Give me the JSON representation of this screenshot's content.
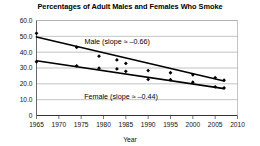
{
  "chart_data": {
    "type": "scatter",
    "title": "Percentages of Adult Males and Females Who Smoke",
    "xlabel": "Year",
    "ylabel": "",
    "xlim": [
      1965,
      2010
    ],
    "ylim": [
      0,
      60
    ],
    "grid": true,
    "legend_position": "inline-annotation",
    "x_ticks": [
      "1965",
      "1970",
      "1975",
      "1980",
      "1985",
      "1990",
      "1995",
      "2000",
      "2005",
      "2010"
    ],
    "y_ticks": [
      "0",
      "10.0",
      "20.0",
      "30.0",
      "40.0",
      "50.0",
      "60.0"
    ],
    "series": [
      {
        "name": "Male",
        "annotation": "Male (slope ≈ –0.66)",
        "slope": -0.66,
        "marker": "diamond",
        "color": "#000000",
        "points": [
          {
            "x": 1965,
            "y": 51.9
          },
          {
            "x": 1974,
            "y": 43.1
          },
          {
            "x": 1979,
            "y": 37.5
          },
          {
            "x": 1983,
            "y": 35.1
          },
          {
            "x": 1985,
            "y": 32.9
          },
          {
            "x": 1990,
            "y": 28.4
          },
          {
            "x": 1995,
            "y": 27.0
          },
          {
            "x": 2000,
            "y": 25.7
          },
          {
            "x": 2005,
            "y": 23.9
          },
          {
            "x": 2007,
            "y": 22.3
          }
        ],
        "fit_line": [
          {
            "x": 1965,
            "y": 49.6
          },
          {
            "x": 2007,
            "y": 21.8
          }
        ]
      },
      {
        "name": "Female",
        "annotation": "Female (slope ≈ –0.44)",
        "slope": -0.44,
        "marker": "diamond",
        "color": "#000000",
        "points": [
          {
            "x": 1965,
            "y": 33.9
          },
          {
            "x": 1974,
            "y": 31.4
          },
          {
            "x": 1979,
            "y": 29.9
          },
          {
            "x": 1983,
            "y": 29.4
          },
          {
            "x": 1985,
            "y": 27.9
          },
          {
            "x": 1990,
            "y": 22.8
          },
          {
            "x": 1995,
            "y": 22.6
          },
          {
            "x": 2000,
            "y": 21.0
          },
          {
            "x": 2005,
            "y": 18.1
          },
          {
            "x": 2007,
            "y": 17.4
          }
        ],
        "fit_line": [
          {
            "x": 1965,
            "y": 34.6
          },
          {
            "x": 2007,
            "y": 17.0
          }
        ]
      }
    ]
  },
  "style": {
    "grid_color": "#aaaaaa",
    "axis_color": "#555555",
    "line_color": "#000000",
    "background": "#ffffff"
  }
}
